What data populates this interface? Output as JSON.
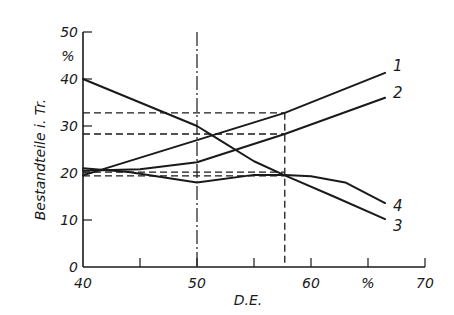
{
  "chart_data": {
    "type": "line",
    "title": "",
    "xlabel": "D.E.",
    "ylabel": "Bestandteile i. Tr.",
    "x_unit": "%",
    "y_unit": "%",
    "xlim": [
      40,
      70
    ],
    "ylim": [
      0,
      50
    ],
    "x_ticks": [
      40,
      45,
      50,
      55,
      60,
      65,
      70
    ],
    "x_tick_labels": [
      "40",
      "",
      "50",
      "",
      "60",
      "%",
      "70"
    ],
    "y_ticks": [
      0,
      10,
      20,
      30,
      40,
      50
    ],
    "y_tick_labels": [
      "0",
      "10",
      "20",
      "30",
      "40",
      "50"
    ],
    "grid": false,
    "legend": "inline curve numbers at right end",
    "series": [
      {
        "name": "1",
        "x": [
          40,
          50,
          57.7,
          66.5
        ],
        "values": [
          19.5,
          27.0,
          32.8,
          41.3
        ]
      },
      {
        "name": "2",
        "x": [
          40,
          45,
          50,
          57.7,
          66.5
        ],
        "values": [
          20.5,
          20.8,
          22.3,
          28.3,
          36.0
        ]
      },
      {
        "name": "3",
        "x": [
          40,
          50,
          52,
          55,
          57.7,
          62,
          66.5
        ],
        "values": [
          40.0,
          30.0,
          27.0,
          22.5,
          19.5,
          15.0,
          10.2
        ]
      },
      {
        "name": "4",
        "x": [
          40,
          44,
          50,
          55,
          57.7,
          60,
          63,
          66.5
        ],
        "values": [
          21.0,
          20.2,
          18.0,
          19.6,
          19.6,
          19.3,
          18.0,
          13.6
        ]
      }
    ],
    "reference_lines": {
      "vertical_dashdot": [
        50
      ],
      "vertical_dashed": [
        57.7
      ],
      "horizontal_dashed": [
        32.8,
        28.3,
        20.2,
        19.4
      ]
    }
  },
  "axes": {
    "y_unit_label": "%",
    "x_unit_label": "%"
  }
}
